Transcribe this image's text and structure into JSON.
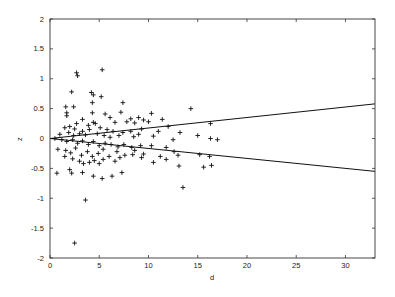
{
  "chart_data": {
    "type": "scatter",
    "title": "",
    "xlabel": "d",
    "ylabel": "z",
    "xlim": [
      0,
      33
    ],
    "ylim": [
      -2,
      2
    ],
    "xticks": [
      0,
      5,
      10,
      15,
      20,
      25,
      30
    ],
    "yticks": [
      -2,
      -1.5,
      -1,
      -0.5,
      0,
      0.5,
      1,
      1.5,
      2
    ],
    "xtick_labels": [
      "0",
      "5",
      "10",
      "15",
      "20",
      "25",
      "30"
    ],
    "ytick_labels": [
      "-2",
      "-1.5",
      "-1",
      "-0.5",
      "0",
      "0.5",
      "1",
      "1.5",
      "2"
    ],
    "grid": false,
    "legend": null,
    "marker": "+",
    "series": [
      {
        "name": "points",
        "type": "scatter",
        "points": [
          [
            2.7,
            1.1
          ],
          [
            2.8,
            1.05
          ],
          [
            5.3,
            1.15
          ],
          [
            2.2,
            0.78
          ],
          [
            4.2,
            0.77
          ],
          [
            4.4,
            0.73
          ],
          [
            5.2,
            0.7
          ],
          [
            1.6,
            0.53
          ],
          [
            2.4,
            0.53
          ],
          [
            4.3,
            0.6
          ],
          [
            7.4,
            0.6
          ],
          [
            1.7,
            0.43
          ],
          [
            4.3,
            0.43
          ],
          [
            5.6,
            0.41
          ],
          [
            7.2,
            0.44
          ],
          [
            10.3,
            0.42
          ],
          [
            14.3,
            0.5
          ],
          [
            1.7,
            0.38
          ],
          [
            3.3,
            0.32
          ],
          [
            6.1,
            0.35
          ],
          [
            8.2,
            0.33
          ],
          [
            9.0,
            0.35
          ],
          [
            9.5,
            0.31
          ],
          [
            11.4,
            0.32
          ],
          [
            2.7,
            0.25
          ],
          [
            3.9,
            0.22
          ],
          [
            4.4,
            0.27
          ],
          [
            4.6,
            0.25
          ],
          [
            6.6,
            0.27
          ],
          [
            7.8,
            0.28
          ],
          [
            8.6,
            0.26
          ],
          [
            10.0,
            0.28
          ],
          [
            12.0,
            0.2
          ],
          [
            16.3,
            0.25
          ],
          [
            1.5,
            0.18
          ],
          [
            2.0,
            0.2
          ],
          [
            2.5,
            0.16
          ],
          [
            3.3,
            0.12
          ],
          [
            4.0,
            0.15
          ],
          [
            5.1,
            0.18
          ],
          [
            5.8,
            0.15
          ],
          [
            6.4,
            0.12
          ],
          [
            7.4,
            0.1
          ],
          [
            8.2,
            0.12
          ],
          [
            9.3,
            0.16
          ],
          [
            11.0,
            0.12
          ],
          [
            13.2,
            0.1
          ],
          [
            1.0,
            0.07
          ],
          [
            1.9,
            0.1
          ],
          [
            2.4,
            0.05
          ],
          [
            3.0,
            0.08
          ],
          [
            3.6,
            0.06
          ],
          [
            4.8,
            0.08
          ],
          [
            5.5,
            0.05
          ],
          [
            6.1,
            0.02
          ],
          [
            7.0,
            0.05
          ],
          [
            8.5,
            0.03
          ],
          [
            9.0,
            0.07
          ],
          [
            10.5,
            0.04
          ],
          [
            12.5,
            -0.02
          ],
          [
            15.0,
            0.05
          ],
          [
            16.3,
            0.0
          ],
          [
            17.0,
            -0.02
          ],
          [
            0.5,
            0.0
          ],
          [
            1.2,
            -0.02
          ],
          [
            1.7,
            -0.05
          ],
          [
            2.3,
            -0.02
          ],
          [
            2.8,
            -0.08
          ],
          [
            3.3,
            -0.04
          ],
          [
            3.9,
            -0.1
          ],
          [
            4.4,
            -0.05
          ],
          [
            5.0,
            -0.12
          ],
          [
            5.6,
            -0.08
          ],
          [
            6.2,
            -0.1
          ],
          [
            6.9,
            -0.14
          ],
          [
            7.5,
            -0.1
          ],
          [
            8.3,
            -0.15
          ],
          [
            9.2,
            -0.12
          ],
          [
            10.3,
            -0.12
          ],
          [
            11.8,
            -0.15
          ],
          [
            12.6,
            -0.22
          ],
          [
            0.8,
            -0.18
          ],
          [
            1.6,
            -0.2
          ],
          [
            2.1,
            -0.24
          ],
          [
            2.6,
            -0.16
          ],
          [
            3.2,
            -0.28
          ],
          [
            3.8,
            -0.22
          ],
          [
            4.3,
            -0.3
          ],
          [
            4.9,
            -0.25
          ],
          [
            5.4,
            -0.18
          ],
          [
            6.0,
            -0.3
          ],
          [
            6.8,
            -0.22
          ],
          [
            7.6,
            -0.28
          ],
          [
            8.6,
            -0.2
          ],
          [
            9.5,
            -0.26
          ],
          [
            11.2,
            -0.3
          ],
          [
            13.0,
            -0.28
          ],
          [
            15.2,
            -0.27
          ],
          [
            16.2,
            -0.3
          ],
          [
            1.5,
            -0.3
          ],
          [
            2.3,
            -0.34
          ],
          [
            3.0,
            -0.38
          ],
          [
            3.4,
            -0.42
          ],
          [
            4.0,
            -0.4
          ],
          [
            4.5,
            -0.37
          ],
          [
            5.0,
            -0.42
          ],
          [
            5.4,
            -0.35
          ],
          [
            6.6,
            -0.38
          ],
          [
            7.1,
            -0.32
          ],
          [
            8.4,
            -0.27
          ],
          [
            9.3,
            -0.32
          ],
          [
            10.5,
            -0.4
          ],
          [
            11.8,
            -0.35
          ],
          [
            13.1,
            -0.46
          ],
          [
            15.6,
            -0.48
          ],
          [
            16.4,
            -0.45
          ],
          [
            0.7,
            -0.58
          ],
          [
            2.0,
            -0.52
          ],
          [
            2.2,
            -0.58
          ],
          [
            3.3,
            -0.57
          ],
          [
            4.4,
            -0.63
          ],
          [
            5.3,
            -0.67
          ],
          [
            6.3,
            -0.63
          ],
          [
            7.3,
            -0.57
          ],
          [
            13.5,
            -0.82
          ],
          [
            3.6,
            -1.03
          ],
          [
            2.5,
            -1.75
          ]
        ]
      },
      {
        "name": "upper bound",
        "type": "line",
        "x": [
          0,
          33
        ],
        "y": [
          0,
          0.58
        ]
      },
      {
        "name": "lower bound",
        "type": "line",
        "x": [
          0,
          33
        ],
        "y": [
          0,
          -0.55
        ]
      }
    ]
  }
}
